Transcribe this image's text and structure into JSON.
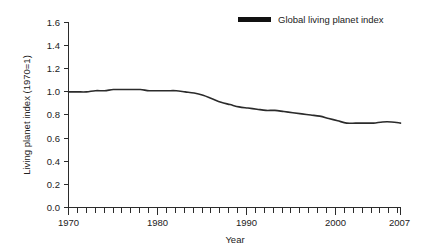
{
  "chart_data": {
    "type": "line",
    "title": "",
    "subtitle": "",
    "xlabel": "Year",
    "ylabel": "Living planet index (1970=1)",
    "xlim": [
      1970,
      2007
    ],
    "ylim": [
      0.0,
      1.6
    ],
    "grid": false,
    "legend_position": "top-right",
    "y_ticks": [
      "0.0",
      "0.2",
      "0.4",
      "0.6",
      "0.8",
      "1.0",
      "1.2",
      "1.4",
      "1.6"
    ],
    "y_tick_values": [
      0.0,
      0.2,
      0.4,
      0.6,
      0.8,
      1.0,
      1.2,
      1.4,
      1.6
    ],
    "x_ticks_labeled": [
      "1970",
      "1980",
      "1990",
      "2000",
      "2007"
    ],
    "x_tick_values_labeled": [
      1970,
      1980,
      1990,
      2000,
      2007
    ],
    "x_minor_tick_step": 1,
    "series": [
      {
        "name": "Global living planet index",
        "color": "#2b2b2b",
        "x": [
          1970,
          1971,
          1972,
          1973,
          1974,
          1975,
          1976,
          1977,
          1978,
          1979,
          1980,
          1981,
          1982,
          1983,
          1984,
          1985,
          1986,
          1987,
          1988,
          1989,
          1990,
          1991,
          1992,
          1993,
          1994,
          1995,
          1996,
          1997,
          1998,
          1999,
          2000,
          2001,
          2002,
          2003,
          2004,
          2005,
          2006,
          2007
        ],
        "values": [
          1.0,
          1.0,
          1.0,
          1.01,
          1.01,
          1.02,
          1.02,
          1.02,
          1.02,
          1.01,
          1.01,
          1.01,
          1.01,
          1.0,
          0.99,
          0.97,
          0.94,
          0.91,
          0.89,
          0.87,
          0.86,
          0.85,
          0.84,
          0.84,
          0.83,
          0.82,
          0.81,
          0.8,
          0.79,
          0.77,
          0.75,
          0.73,
          0.73,
          0.73,
          0.73,
          0.74,
          0.74,
          0.73
        ]
      }
    ]
  },
  "legend": {
    "entries": [
      {
        "label": "Global living planet index",
        "swatch_color": "#111111"
      }
    ]
  },
  "axes": {
    "y_title": "Living planet index (1970=1)",
    "x_title": "Year"
  }
}
